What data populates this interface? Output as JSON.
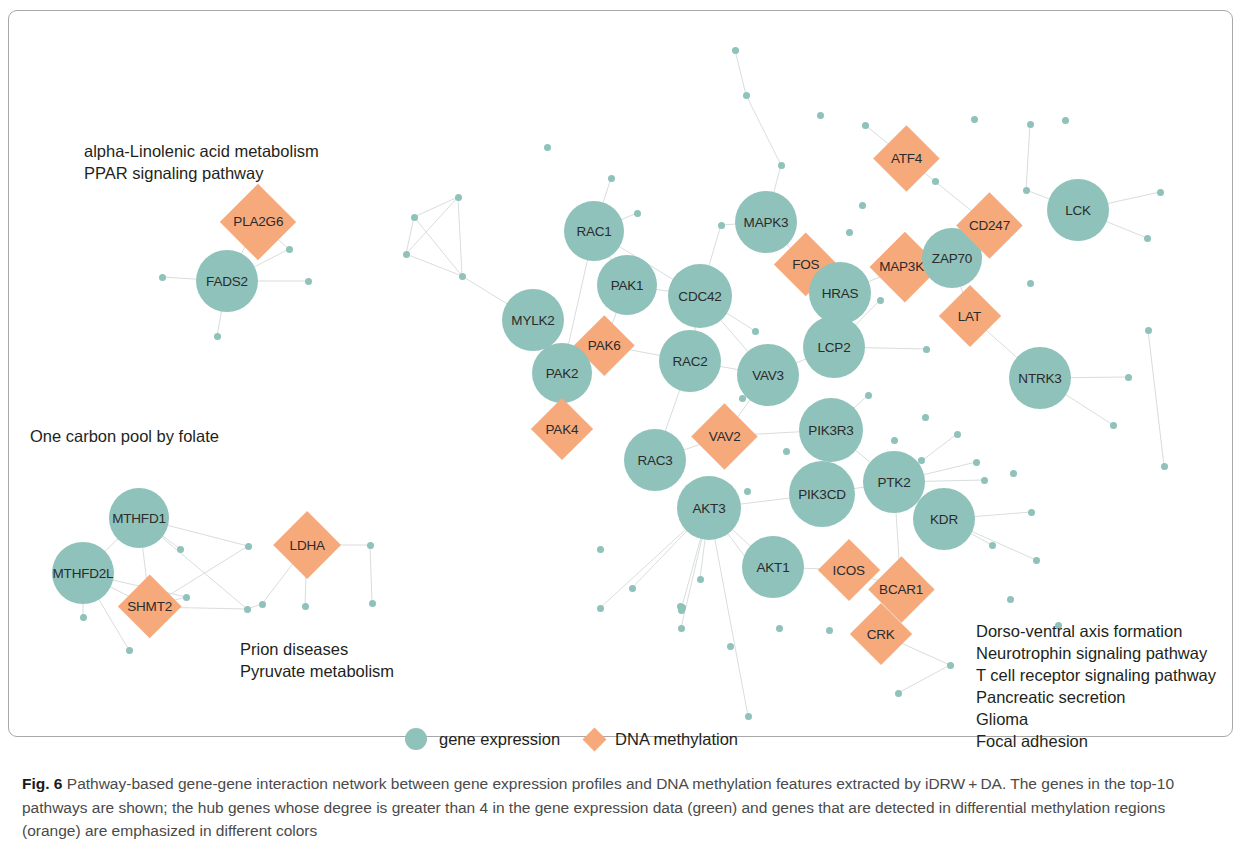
{
  "figure": {
    "caption_prefix": "Fig. 6",
    "caption_text": " Pathway-based gene-gene interaction network between gene expression profiles and DNA methylation features extracted by iDRW + DA. The genes in the top-10 pathways are shown; the hub genes whose degree is greater than 4 in the gene expression data (green) and genes that are detected in differential methylation regions (orange) are emphasized in different colors"
  },
  "legend": {
    "gene_expression_label": "gene expression",
    "dna_methylation_label": "DNA methylation"
  },
  "colors": {
    "gene_expression": "#8fc2ba",
    "dna_methylation": "#f6a97b",
    "edge": "#d8dcdc",
    "frame": "#a8a8a8"
  },
  "pathway_labels": [
    {
      "id": "top-left",
      "lines": [
        "alpha-Linolenic acid metabolism",
        "PPAR signaling pathway"
      ],
      "x": 84,
      "y": 140
    },
    {
      "id": "mid-left",
      "lines": [
        "One carbon pool by folate"
      ],
      "x": 30,
      "y": 425
    },
    {
      "id": "bottom-center",
      "lines": [
        "Prion diseases",
        "Pyruvate metabolism"
      ],
      "x": 240,
      "y": 638
    },
    {
      "id": "bottom-right",
      "lines": [
        "Dorso-ventral axis formation",
        "Neurotrophin signaling pathway",
        "T cell receptor signaling pathway",
        "Pancreatic secretion",
        "Glioma",
        "Focal adhesion"
      ],
      "x": 976,
      "y": 620
    }
  ],
  "chart_data": {
    "type": "network",
    "title": "Pathway-based gene-gene interaction network",
    "node_types": {
      "circle": "gene expression",
      "diamond": "DNA methylation"
    },
    "labeled_nodes": [
      {
        "label": "PLA2G6",
        "type": "diamond",
        "x": 258,
        "y": 222,
        "r": 38
      },
      {
        "label": "FADS2",
        "type": "circle",
        "x": 227,
        "y": 281,
        "r": 31
      },
      {
        "label": "MTHFD1",
        "type": "circle",
        "x": 139,
        "y": 518,
        "r": 30
      },
      {
        "label": "MTHFD2L",
        "type": "circle",
        "x": 83,
        "y": 573,
        "r": 31
      },
      {
        "label": "SHMT2",
        "type": "diamond",
        "x": 150,
        "y": 607,
        "r": 32
      },
      {
        "label": "LDHA",
        "type": "diamond",
        "x": 307,
        "y": 545,
        "r": 34
      },
      {
        "label": "RAC1",
        "type": "circle",
        "x": 594,
        "y": 231,
        "r": 30
      },
      {
        "label": "MAPK3",
        "type": "circle",
        "x": 766,
        "y": 222,
        "r": 31
      },
      {
        "label": "FOS",
        "type": "diamond",
        "x": 806,
        "y": 265,
        "r": 32
      },
      {
        "label": "MAP3K3",
        "type": "diamond",
        "x": 905,
        "y": 267,
        "r": 35
      },
      {
        "label": "ZAP70",
        "type": "circle",
        "x": 952,
        "y": 258,
        "r": 30
      },
      {
        "label": "CD247",
        "type": "diamond",
        "x": 989,
        "y": 225,
        "r": 33
      },
      {
        "label": "ATF4",
        "type": "diamond",
        "x": 906,
        "y": 158,
        "r": 33
      },
      {
        "label": "LCK",
        "type": "circle",
        "x": 1078,
        "y": 210,
        "r": 31
      },
      {
        "label": "LAT",
        "type": "diamond",
        "x": 970,
        "y": 316,
        "r": 31
      },
      {
        "label": "HRAS",
        "type": "circle",
        "x": 840,
        "y": 293,
        "r": 31
      },
      {
        "label": "PAK1",
        "type": "circle",
        "x": 627,
        "y": 285,
        "r": 30
      },
      {
        "label": "CDC42",
        "type": "circle",
        "x": 700,
        "y": 296,
        "r": 32
      },
      {
        "label": "MYLK2",
        "type": "circle",
        "x": 533,
        "y": 320,
        "r": 31
      },
      {
        "label": "PAK6",
        "type": "diamond",
        "x": 604,
        "y": 345,
        "r": 30
      },
      {
        "label": "PAK2",
        "type": "circle",
        "x": 562,
        "y": 373,
        "r": 30
      },
      {
        "label": "RAC2",
        "type": "circle",
        "x": 690,
        "y": 361,
        "r": 31
      },
      {
        "label": "VAV3",
        "type": "circle",
        "x": 768,
        "y": 375,
        "r": 31
      },
      {
        "label": "LCP2",
        "type": "circle",
        "x": 834,
        "y": 347,
        "r": 31
      },
      {
        "label": "NTRK3",
        "type": "circle",
        "x": 1040,
        "y": 378,
        "r": 31
      },
      {
        "label": "PAK4",
        "type": "diamond",
        "x": 562,
        "y": 429,
        "r": 31
      },
      {
        "label": "VAV2",
        "type": "diamond",
        "x": 724,
        "y": 436,
        "r": 33
      },
      {
        "label": "PIK3R3",
        "type": "circle",
        "x": 831,
        "y": 430,
        "r": 32
      },
      {
        "label": "RAC3",
        "type": "circle",
        "x": 655,
        "y": 460,
        "r": 31
      },
      {
        "label": "PTK2",
        "type": "circle",
        "x": 894,
        "y": 482,
        "r": 31
      },
      {
        "label": "PIK3CD",
        "type": "circle",
        "x": 822,
        "y": 494,
        "r": 33
      },
      {
        "label": "AKT3",
        "type": "circle",
        "x": 709,
        "y": 508,
        "r": 32
      },
      {
        "label": "KDR",
        "type": "circle",
        "x": 944,
        "y": 519,
        "r": 31
      },
      {
        "label": "AKT1",
        "type": "circle",
        "x": 773,
        "y": 567,
        "r": 31
      },
      {
        "label": "ICOS",
        "type": "diamond",
        "x": 849,
        "y": 570,
        "r": 31
      },
      {
        "label": "BCAR1",
        "type": "diamond",
        "x": 901,
        "y": 589,
        "r": 33
      },
      {
        "label": "CRK",
        "type": "diamond",
        "x": 881,
        "y": 634,
        "r": 31
      }
    ],
    "small_nodes": [
      {
        "x": 414,
        "y": 217
      },
      {
        "x": 458,
        "y": 197
      },
      {
        "x": 406,
        "y": 254
      },
      {
        "x": 462,
        "y": 276
      },
      {
        "x": 547,
        "y": 147
      },
      {
        "x": 611,
        "y": 178
      },
      {
        "x": 735,
        "y": 50
      },
      {
        "x": 746,
        "y": 95
      },
      {
        "x": 781,
        "y": 165
      },
      {
        "x": 820,
        "y": 115
      },
      {
        "x": 862,
        "y": 205
      },
      {
        "x": 865,
        "y": 125
      },
      {
        "x": 935,
        "y": 181
      },
      {
        "x": 974,
        "y": 119
      },
      {
        "x": 1026,
        "y": 190
      },
      {
        "x": 1030,
        "y": 124
      },
      {
        "x": 1065,
        "y": 120
      },
      {
        "x": 1160,
        "y": 192
      },
      {
        "x": 1147,
        "y": 238
      },
      {
        "x": 1148,
        "y": 330
      },
      {
        "x": 1128,
        "y": 377
      },
      {
        "x": 1113,
        "y": 425
      },
      {
        "x": 1164,
        "y": 466
      },
      {
        "x": 1030,
        "y": 283
      },
      {
        "x": 926,
        "y": 349
      },
      {
        "x": 880,
        "y": 300
      },
      {
        "x": 925,
        "y": 417
      },
      {
        "x": 894,
        "y": 440
      },
      {
        "x": 868,
        "y": 395
      },
      {
        "x": 957,
        "y": 434
      },
      {
        "x": 976,
        "y": 462
      },
      {
        "x": 921,
        "y": 460
      },
      {
        "x": 1013,
        "y": 473
      },
      {
        "x": 984,
        "y": 480
      },
      {
        "x": 992,
        "y": 545
      },
      {
        "x": 1031,
        "y": 512
      },
      {
        "x": 1036,
        "y": 560
      },
      {
        "x": 1010,
        "y": 599
      },
      {
        "x": 1058,
        "y": 625
      },
      {
        "x": 950,
        "y": 665
      },
      {
        "x": 898,
        "y": 693
      },
      {
        "x": 748,
        "y": 716
      },
      {
        "x": 730,
        "y": 646
      },
      {
        "x": 829,
        "y": 630
      },
      {
        "x": 779,
        "y": 628
      },
      {
        "x": 681,
        "y": 628
      },
      {
        "x": 751,
        "y": 565
      },
      {
        "x": 700,
        "y": 579
      },
      {
        "x": 681,
        "y": 610
      },
      {
        "x": 600,
        "y": 608
      },
      {
        "x": 682,
        "y": 607
      },
      {
        "x": 632,
        "y": 588
      },
      {
        "x": 680,
        "y": 606
      },
      {
        "x": 600,
        "y": 549
      },
      {
        "x": 681,
        "y": 607
      },
      {
        "x": 747,
        "y": 491
      },
      {
        "x": 742,
        "y": 398
      },
      {
        "x": 820,
        "y": 409
      },
      {
        "x": 786,
        "y": 451
      },
      {
        "x": 849,
        "y": 232
      },
      {
        "x": 755,
        "y": 331
      },
      {
        "x": 721,
        "y": 225
      },
      {
        "x": 637,
        "y": 213
      },
      {
        "x": 289,
        "y": 249
      },
      {
        "x": 162,
        "y": 277
      },
      {
        "x": 308,
        "y": 281
      },
      {
        "x": 217,
        "y": 336
      },
      {
        "x": 180,
        "y": 549
      },
      {
        "x": 186,
        "y": 597
      },
      {
        "x": 248,
        "y": 546
      },
      {
        "x": 247,
        "y": 609
      },
      {
        "x": 129,
        "y": 650
      },
      {
        "x": 370,
        "y": 545
      },
      {
        "x": 372,
        "y": 603
      },
      {
        "x": 262,
        "y": 604
      },
      {
        "x": 305,
        "y": 606
      },
      {
        "x": 83,
        "y": 617
      }
    ],
    "edges": [
      [
        258,
        222,
        227,
        281
      ],
      [
        227,
        281,
        289,
        249
      ],
      [
        227,
        281,
        162,
        277
      ],
      [
        227,
        281,
        308,
        281
      ],
      [
        227,
        281,
        217,
        336
      ],
      [
        258,
        222,
        289,
        249
      ],
      [
        139,
        518,
        83,
        573
      ],
      [
        139,
        518,
        150,
        607
      ],
      [
        83,
        573,
        150,
        607
      ],
      [
        139,
        518,
        248,
        546
      ],
      [
        150,
        607,
        247,
        609
      ],
      [
        83,
        573,
        129,
        650
      ],
      [
        139,
        518,
        180,
        549
      ],
      [
        150,
        607,
        186,
        597
      ],
      [
        83,
        573,
        186,
        597
      ],
      [
        139,
        518,
        247,
        609
      ],
      [
        83,
        573,
        83,
        617
      ],
      [
        150,
        607,
        248,
        546
      ],
      [
        307,
        545,
        305,
        606
      ],
      [
        307,
        545,
        370,
        545
      ],
      [
        307,
        545,
        262,
        604
      ],
      [
        262,
        604,
        247,
        609
      ],
      [
        370,
        545,
        372,
        603
      ],
      [
        414,
        217,
        458,
        197
      ],
      [
        414,
        217,
        406,
        254
      ],
      [
        458,
        197,
        462,
        276
      ],
      [
        406,
        254,
        462,
        276
      ],
      [
        458,
        197,
        406,
        254
      ],
      [
        462,
        276,
        533,
        320
      ],
      [
        414,
        217,
        462,
        276
      ],
      [
        594,
        231,
        627,
        285
      ],
      [
        594,
        231,
        637,
        213
      ],
      [
        594,
        231,
        562,
        373
      ],
      [
        627,
        285,
        604,
        345
      ],
      [
        627,
        285,
        700,
        296
      ],
      [
        594,
        231,
        700,
        296
      ],
      [
        533,
        320,
        562,
        373
      ],
      [
        562,
        373,
        604,
        345
      ],
      [
        562,
        373,
        562,
        429
      ],
      [
        604,
        345,
        690,
        361
      ],
      [
        700,
        296,
        690,
        361
      ],
      [
        700,
        296,
        768,
        375
      ],
      [
        690,
        361,
        655,
        460
      ],
      [
        690,
        361,
        768,
        375
      ],
      [
        655,
        460,
        724,
        436
      ],
      [
        724,
        436,
        768,
        375
      ],
      [
        724,
        436,
        831,
        430
      ],
      [
        768,
        375,
        834,
        347
      ],
      [
        834,
        347,
        840,
        293
      ],
      [
        840,
        293,
        806,
        265
      ],
      [
        806,
        265,
        766,
        222
      ],
      [
        766,
        222,
        721,
        225
      ],
      [
        766,
        222,
        781,
        165
      ],
      [
        781,
        165,
        746,
        95
      ],
      [
        746,
        95,
        735,
        50
      ],
      [
        840,
        293,
        905,
        267
      ],
      [
        905,
        267,
        952,
        258
      ],
      [
        952,
        258,
        989,
        225
      ],
      [
        989,
        225,
        906,
        158
      ],
      [
        906,
        158,
        865,
        125
      ],
      [
        952,
        258,
        970,
        316
      ],
      [
        970,
        316,
        1040,
        378
      ],
      [
        1078,
        210,
        1160,
        192
      ],
      [
        1078,
        210,
        1026,
        190
      ],
      [
        1026,
        190,
        1030,
        124
      ],
      [
        831,
        430,
        822,
        494
      ],
      [
        831,
        430,
        894,
        482
      ],
      [
        822,
        494,
        894,
        482
      ],
      [
        894,
        482,
        944,
        519
      ],
      [
        822,
        494,
        709,
        508
      ],
      [
        709,
        508,
        773,
        567
      ],
      [
        773,
        567,
        849,
        570
      ],
      [
        849,
        570,
        901,
        589
      ],
      [
        901,
        589,
        881,
        634
      ],
      [
        894,
        482,
        901,
        589
      ],
      [
        944,
        519,
        1031,
        512
      ],
      [
        944,
        519,
        992,
        545
      ],
      [
        944,
        519,
        1036,
        560
      ],
      [
        881,
        634,
        950,
        665
      ],
      [
        950,
        665,
        898,
        693
      ],
      [
        709,
        508,
        681,
        610
      ],
      [
        709,
        508,
        600,
        608
      ],
      [
        709,
        508,
        748,
        716
      ],
      [
        709,
        508,
        632,
        588
      ],
      [
        709,
        508,
        681,
        628
      ],
      [
        709,
        508,
        751,
        565
      ],
      [
        709,
        508,
        700,
        579
      ],
      [
        1040,
        378,
        1128,
        377
      ],
      [
        1040,
        378,
        1113,
        425
      ],
      [
        831,
        430,
        868,
        395
      ],
      [
        894,
        482,
        921,
        460
      ],
      [
        894,
        482,
        957,
        434
      ],
      [
        894,
        482,
        976,
        462
      ],
      [
        894,
        482,
        984,
        480
      ],
      [
        834,
        347,
        880,
        300
      ],
      [
        834,
        347,
        926,
        349
      ],
      [
        768,
        375,
        742,
        398
      ],
      [
        700,
        296,
        755,
        331
      ],
      [
        1147,
        238,
        1078,
        210
      ],
      [
        1148,
        330,
        1164,
        466
      ],
      [
        700,
        296,
        721,
        225
      ],
      [
        594,
        231,
        611,
        178
      ]
    ]
  }
}
